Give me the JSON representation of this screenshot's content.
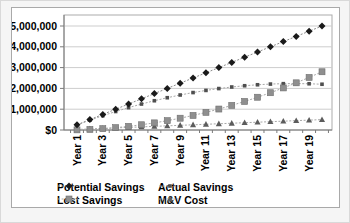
{
  "chart_data": {
    "type": "line",
    "title": "",
    "x_axis": {
      "unit": "Year",
      "categories": [
        1,
        2,
        3,
        4,
        5,
        6,
        7,
        8,
        9,
        10,
        11,
        12,
        13,
        14,
        15,
        16,
        17,
        18,
        19,
        20
      ],
      "tick_labels": [
        "Year 1",
        "Year 3",
        "Year 5",
        "Year 7",
        "Year 9",
        "Year 11",
        "Year 13",
        "Year 15",
        "Year 17",
        "Year 19"
      ]
    },
    "y_axis": {
      "min": 0,
      "max": 5000000,
      "major_unit": 1000000,
      "tick_labels": [
        "$0",
        "$1,000,000",
        "$2,000,000",
        "$3,000,000",
        "$4,000,000",
        "$5,000,000"
      ]
    },
    "grid": "horizontal",
    "legend": {
      "position": "bottom",
      "columns": 2
    },
    "series": [
      {
        "name": "Potential Savings",
        "marker": "diamond",
        "color": "#1a1a1a",
        "line_color": "#8c8c8c",
        "values": [
          250000,
          500000,
          750000,
          1000000,
          1250000,
          1500000,
          1750000,
          2000000,
          2250000,
          2500000,
          2750000,
          3000000,
          3250000,
          3500000,
          3750000,
          4000000,
          4250000,
          4500000,
          4750000,
          5000000
        ]
      },
      {
        "name": "Actual Savings",
        "marker": "small-square",
        "color": "#4f4f4f",
        "line_color": "#a8a8a8",
        "values": [
          243000,
          472000,
          687000,
          888000,
          1075000,
          1248000,
          1407000,
          1552000,
          1683000,
          1800000,
          1903000,
          1992000,
          2067000,
          2128000,
          2175000,
          2208000,
          2227000,
          2232000,
          2223000,
          2200000
        ]
      },
      {
        "name": "Lost Savings",
        "marker": "square",
        "color": "#8f8f8f",
        "line_color": "#a8a8a8",
        "values": [
          7000,
          28000,
          63000,
          112000,
          175000,
          252000,
          343000,
          448000,
          567000,
          700000,
          847000,
          1008000,
          1183000,
          1372000,
          1575000,
          1792000,
          2023000,
          2268000,
          2527000,
          2800000
        ]
      },
      {
        "name": "M&V Cost",
        "marker": "triangle",
        "color": "#5c5c5c",
        "line_color": "#a8a8a8",
        "values": [
          25000,
          50000,
          75000,
          100000,
          125000,
          150000,
          175000,
          200000,
          225000,
          250000,
          275000,
          300000,
          325000,
          350000,
          375000,
          400000,
          425000,
          450000,
          475000,
          500000
        ]
      }
    ]
  },
  "colors": {
    "plot_border": "#ababab",
    "gridline": "#cdcdcd",
    "axis": "#7a7a7a",
    "background": "#ffffff"
  }
}
